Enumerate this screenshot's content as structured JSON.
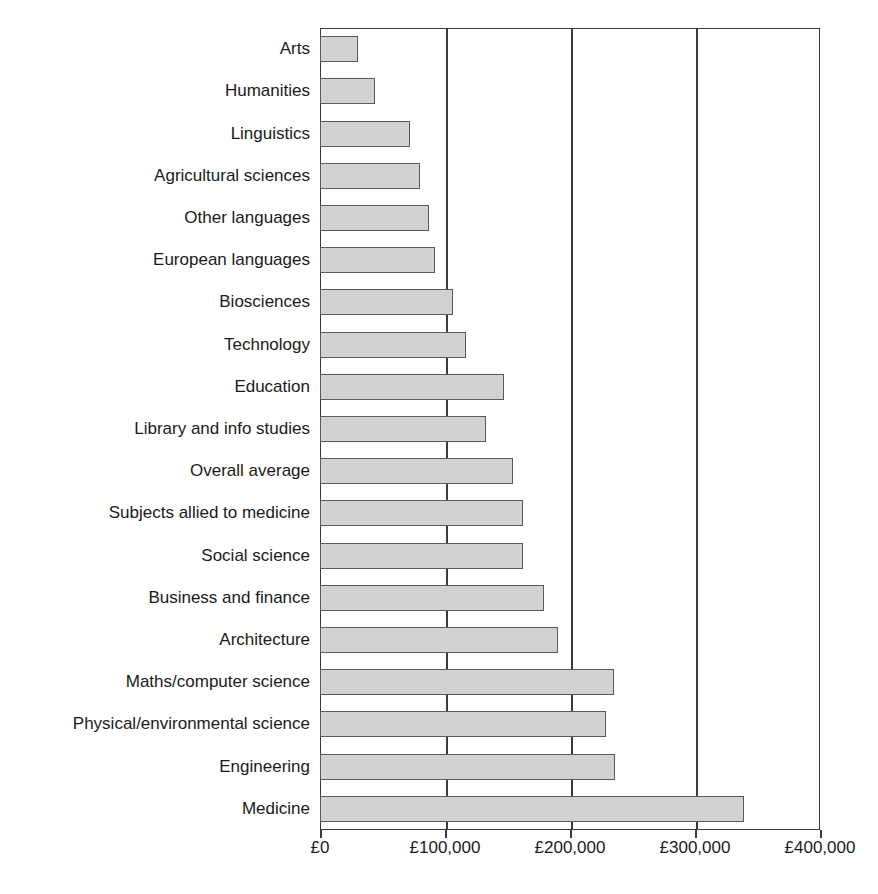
{
  "chart_data": {
    "type": "bar",
    "orientation": "horizontal",
    "title": "",
    "subtitle": "",
    "xlabel": "",
    "ylabel": "",
    "xlim": [
      0,
      400000
    ],
    "ylim": null,
    "grid": true,
    "gridlines_x": [
      100000,
      200000,
      300000
    ],
    "legend": null,
    "legend_position": "none",
    "currency": "GBP",
    "x_tick_labels": [
      "£0",
      "£100,000",
      "£200,000",
      "£300,000",
      "£400,000"
    ],
    "x_tick_values": [
      0,
      100000,
      200000,
      300000,
      400000
    ],
    "categories": [
      "Arts",
      "Humanities",
      "Linguistics",
      "Agricultural sciences",
      "Other languages",
      "European languages",
      "Biosciences",
      "Technology",
      "Education",
      "Library and info studies",
      "Overall average",
      "Subjects allied to medicine",
      "Social science",
      "Business and finance",
      "Architecture",
      "Maths/computer science",
      "Physical/environmental science",
      "Engineering",
      "Medicine"
    ],
    "values": [
      30000,
      44000,
      72000,
      80000,
      87000,
      92000,
      106000,
      117000,
      147000,
      133000,
      154000,
      162000,
      162000,
      179000,
      190000,
      235000,
      229000,
      236000,
      339000
    ],
    "colors": {
      "bar_fill": "#d2d2d2",
      "bar_border": "#5a5a5a",
      "axis": "#3b3b3b",
      "text": "#1a1a1a",
      "background": "#ffffff"
    }
  }
}
